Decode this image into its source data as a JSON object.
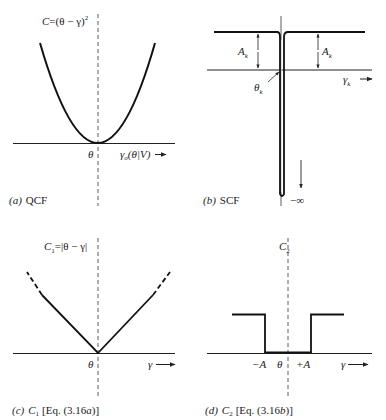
{
  "figure": {
    "panels": [
      {
        "id": "a",
        "caption_letter": "(a)",
        "caption_text": "QCF",
        "ylabel_C": "C",
        "ylabel_eq": "=(θ − γ)",
        "ylabel_sup": "2",
        "origin_label": "θ",
        "xlabel_main": "γ",
        "xlabel_sub": "o",
        "xlabel_rest": "(θ|V)",
        "arrow": "→"
      },
      {
        "id": "b",
        "caption_letter": "(b)",
        "caption_text": "SCF",
        "amp_label_left": "A",
        "amp_label_right": "A",
        "amp_sub": "k",
        "theta_label": "θ",
        "theta_sub": "k",
        "xlabel_main": "γ",
        "xlabel_sub": "k",
        "arrow": "→",
        "neg_inf": "−∞"
      },
      {
        "id": "c",
        "caption_letter": "(c)",
        "caption_C": "C",
        "caption_sub": "1",
        "caption_eq": "[Eq. (3.16",
        "caption_eq_letter": "a",
        "caption_eq_end": ")]",
        "ylabel_C": "C",
        "ylabel_sub": "1",
        "ylabel_eq": "=|θ − γ|",
        "origin_label": "θ",
        "xlabel": "γ",
        "arrow": "→"
      },
      {
        "id": "d",
        "caption_letter": "(d)",
        "caption_C": "C",
        "caption_sub": "2",
        "caption_eq": "[Eq. (3.16",
        "caption_eq_letter": "b",
        "caption_eq_end": ")]",
        "ylabel_C": "C",
        "ylabel_sub": "2",
        "minus_A": "−A",
        "origin_label": "θ",
        "plus_A": "+A",
        "xlabel": "γ",
        "arrow": "→"
      }
    ]
  },
  "colors": {
    "ink": "#1a1a1a",
    "background": "#ffffff"
  }
}
